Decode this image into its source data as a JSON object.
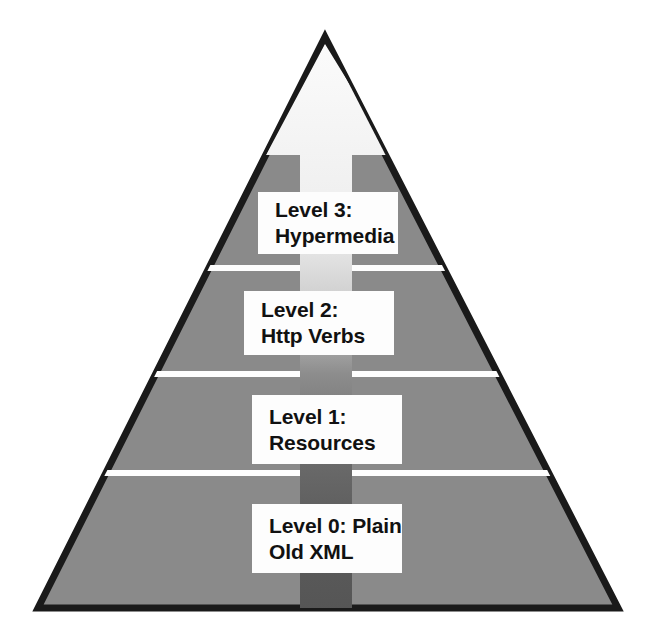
{
  "diagram": {
    "type": "pyramid",
    "shape": {
      "apex_label": "pyramid-apex",
      "base_left_label": "pyramid-base-left",
      "base_right_label": "pyramid-base-right"
    },
    "colors": {
      "pyramid_fill": "#8a8a8a",
      "pyramid_outline": "#1a1a1a",
      "divider": "#ffffff",
      "box_fill": "#fdfdfd",
      "box_text": "#111111",
      "arrow_top": "#f7f7f7",
      "arrow_bottom": "#5a5a5a",
      "page_background": "#ffffff"
    },
    "arrow": {
      "name": "upward-arrow",
      "direction": "up",
      "description": "gradient arrow pointing up through the pyramid"
    },
    "levels": [
      {
        "id": "level-3",
        "order": 3,
        "line1": "Level 3:",
        "line2": "Hypermedia"
      },
      {
        "id": "level-2",
        "order": 2,
        "line1": "Level 2:",
        "line2": "Http Verbs"
      },
      {
        "id": "level-1",
        "order": 1,
        "line1": "Level 1:",
        "line2": "Resources"
      },
      {
        "id": "level-0",
        "order": 0,
        "line1": "Level 0: Plain",
        "line2": "Old XML"
      }
    ],
    "dividers": [
      {
        "id": "divider-3-2",
        "y": 268
      },
      {
        "id": "divider-2-1",
        "y": 374
      },
      {
        "id": "divider-1-0",
        "y": 473
      }
    ]
  }
}
